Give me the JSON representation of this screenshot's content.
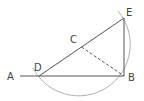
{
  "diagram": {
    "points": {
      "A": {
        "label": "A",
        "x": 20,
        "y": 76
      },
      "D": {
        "label": "D",
        "x": 39,
        "y": 76
      },
      "B": {
        "label": "B",
        "x": 124,
        "y": 76
      },
      "E": {
        "label": "E",
        "x": 124,
        "y": 18
      },
      "C": {
        "label": "C",
        "x": 81.5,
        "y": 47
      }
    },
    "segments": [
      {
        "from": "A",
        "to": "B",
        "style": "solid"
      },
      {
        "from": "D",
        "to": "E",
        "style": "solid"
      },
      {
        "from": "E",
        "to": "B",
        "style": "solid"
      },
      {
        "from": "C",
        "to": "B",
        "style": "dashed"
      }
    ],
    "arc": {
      "center": "C",
      "radius": 51.5,
      "from": "E",
      "to": "D",
      "direction": "clockwise-through-B"
    },
    "colors": {
      "line": "#555555",
      "arc": "#aaaaaa",
      "label": "#444444"
    }
  }
}
